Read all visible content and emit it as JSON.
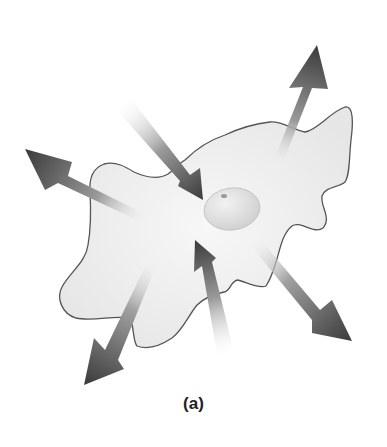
{
  "figure": {
    "caption": "(a)",
    "colors": {
      "background": "#ffffff",
      "cell_fill": "#eeeeee",
      "cell_outline": "#555555",
      "nucleus_fill": "#e2e2e2",
      "nucleolus": "#999999",
      "arrow_dark": "#3a3a3a",
      "arrow_light": "#ffffff",
      "caption": "#222222"
    },
    "arrows": [
      {
        "id": "outward-top-left",
        "direction": "outward"
      },
      {
        "id": "outward-top-right",
        "direction": "outward"
      },
      {
        "id": "outward-bottom-left",
        "direction": "outward"
      },
      {
        "id": "outward-bottom-right",
        "direction": "outward"
      },
      {
        "id": "inward-top",
        "direction": "inward"
      },
      {
        "id": "inward-bottom",
        "direction": "inward"
      }
    ]
  }
}
